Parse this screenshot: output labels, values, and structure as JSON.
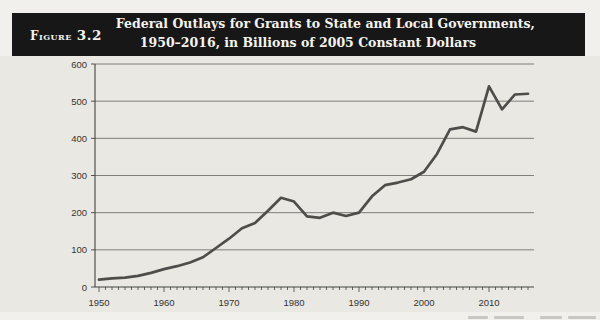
{
  "figure": {
    "label_word": "Figure",
    "label_number": "3.2",
    "title_line1": "Federal Outlays for Grants to State and Local Governments,",
    "title_line2": "1950–2016, in Billions of 2005 Constant Dollars"
  },
  "chart_data": {
    "type": "line",
    "title": "Federal Outlays for Grants to State and Local Governments, 1950–2016, in Billions of 2005 Constant Dollars",
    "x": [
      1950,
      1952,
      1954,
      1956,
      1958,
      1960,
      1962,
      1964,
      1966,
      1968,
      1970,
      1972,
      1974,
      1976,
      1978,
      1980,
      1982,
      1984,
      1986,
      1988,
      1990,
      1992,
      1994,
      1996,
      1998,
      2000,
      2002,
      2004,
      2006,
      2008,
      2010,
      2012,
      2014,
      2016
    ],
    "values": [
      20,
      23,
      25,
      30,
      38,
      48,
      56,
      66,
      80,
      105,
      130,
      158,
      172,
      205,
      240,
      230,
      190,
      186,
      200,
      191,
      200,
      244,
      274,
      281,
      290,
      310,
      358,
      424,
      430,
      418,
      540,
      478,
      518,
      520
    ],
    "xlabel": "",
    "ylabel": "",
    "xlim": [
      1950,
      2017
    ],
    "ylim": [
      0,
      600
    ],
    "y_ticks": [
      0,
      100,
      200,
      300,
      400,
      500,
      600
    ],
    "x_tick_labels": [
      1950,
      1960,
      1970,
      1980,
      1990,
      2000,
      2010
    ],
    "minor_tick_interval_years": 1,
    "grid": "horizontal",
    "legend": "none",
    "line_color": "#4e4d4b",
    "grid_color": "#64635f",
    "axis_color": "#434240",
    "tick_label_color": "#343330"
  }
}
